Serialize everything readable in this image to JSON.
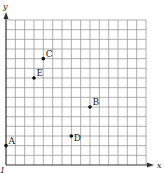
{
  "chart_data": {
    "type": "scatter",
    "title": "",
    "xlabel": "x",
    "ylabel": "y",
    "grid": true,
    "xlim": [
      0,
      15
    ],
    "ylim": [
      0,
      15
    ],
    "points": [
      {
        "label": "A",
        "x": 0,
        "y": 2
      },
      {
        "label": "B",
        "x": 9,
        "y": 6
      },
      {
        "label": "C",
        "x": 4,
        "y": 11
      },
      {
        "label": "D",
        "x": 7,
        "y": 3
      },
      {
        "label": "E",
        "x": 3,
        "y": 9
      }
    ]
  },
  "axes": {
    "x_label": "x",
    "y_label": "y"
  },
  "colors": {
    "grid": "#9a9a9a",
    "axis": "#333333",
    "point": "#111111"
  }
}
